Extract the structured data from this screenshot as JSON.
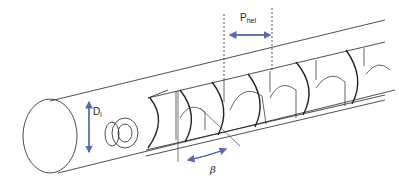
{
  "diagram": {
    "labels": {
      "diameter": {
        "main": "D",
        "sub": "i"
      },
      "pitch": {
        "main": "P",
        "sub": "hel"
      },
      "angle": "β"
    },
    "colors": {
      "line": "#222222",
      "arrow": "#5a6aae",
      "background": "#ffffff"
    }
  }
}
